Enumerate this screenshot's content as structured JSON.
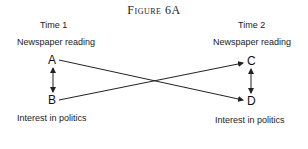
{
  "figure": {
    "title": "Figure 6A",
    "left": {
      "time": "Time 1",
      "top_variable": "Newspaper reading",
      "bottom_variable": "Interest in politics",
      "top_node": "A",
      "bottom_node": "B"
    },
    "right": {
      "time": "Time 2",
      "top_variable": "Newspaper reading",
      "bottom_variable": "Interest in politics",
      "top_node": "C",
      "bottom_node": "D"
    },
    "edges": [
      {
        "from": "A",
        "to": "B",
        "type": "bidirectional"
      },
      {
        "from": "C",
        "to": "D",
        "type": "bidirectional"
      },
      {
        "from": "A",
        "to": "D",
        "type": "directed"
      },
      {
        "from": "B",
        "to": "C",
        "type": "directed"
      }
    ],
    "line_color": "#222222"
  }
}
